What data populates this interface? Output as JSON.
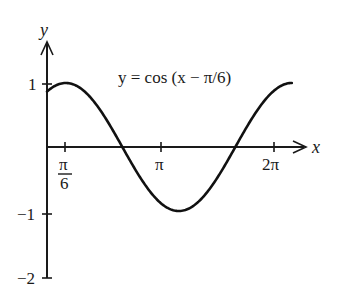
{
  "chart_data": {
    "type": "line",
    "title": "",
    "annotation": "y = cos (x − π/6)",
    "xlabel": "x",
    "ylabel": "y",
    "function": "cos(x - pi/6)",
    "x_range": [
      0,
      6.806784
    ],
    "xlim": [
      0,
      7.2
    ],
    "ylim": [
      -2,
      1.55
    ],
    "x_ticks": [
      {
        "value": 0.5235988,
        "label_num": "π",
        "label_den": "6"
      },
      {
        "value": 3.1415927,
        "label": "π"
      },
      {
        "value": 6.2831853,
        "label": "2π"
      }
    ],
    "y_ticks": [
      {
        "value": 1,
        "label": "1"
      },
      {
        "value": -1,
        "label": "−1"
      },
      {
        "value": -2,
        "label": "−2"
      }
    ],
    "grid": false,
    "legend": null,
    "series": [
      {
        "name": "y = cos (x − π/6)",
        "x": [
          0,
          0.5236,
          1.0472,
          1.5708,
          2.0944,
          2.618,
          3.1416,
          3.6652,
          4.1888,
          4.7124,
          5.236,
          5.7596,
          6.2832,
          6.8068
        ],
        "y": [
          0.866,
          1.0,
          0.866,
          0.5,
          0.0,
          -0.5,
          -0.866,
          -1.0,
          -0.866,
          -0.5,
          0.0,
          0.5,
          0.866,
          1.0
        ]
      }
    ]
  },
  "labels": {
    "y_axis": "y",
    "x_axis": "x",
    "tick_pi6_num": "π",
    "tick_pi6_den": "6",
    "tick_pi": "π",
    "tick_2pi": "2π",
    "tick_1": "1",
    "tick_m1": "−1",
    "tick_m2": "−2",
    "equation": "y = cos (x − π/6)"
  }
}
